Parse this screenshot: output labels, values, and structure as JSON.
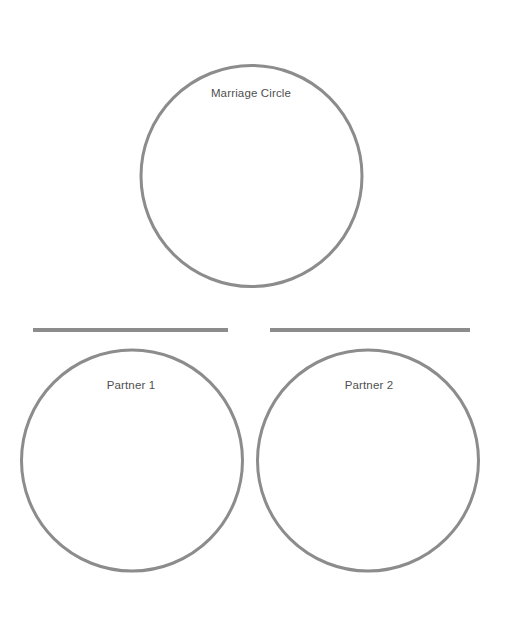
{
  "page": {
    "background_color": "#ffffff",
    "width": 505,
    "height": 633
  },
  "style": {
    "stroke_color": "#8c8c8c",
    "stroke_width": 3,
    "bar_color": "#8c8c8c",
    "label_color": "#4f4f4f"
  },
  "diagram": {
    "type": "venn-style-circles",
    "circles": [
      {
        "id": "marriage-circle",
        "label": "Marriage Circle",
        "cx": 251.5,
        "cy": 176,
        "r": 110.5
      },
      {
        "id": "partner-1-circle",
        "label": "Partner 1",
        "cx": 132,
        "cy": 460.5,
        "r": 110.5
      },
      {
        "id": "partner-2-circle",
        "label": "Partner 2",
        "cx": 368,
        "cy": 460.5,
        "r": 110.5
      }
    ],
    "bars": [
      {
        "id": "left-divider-bar",
        "x1": 33,
        "x2": 228,
        "y": 330,
        "thickness": 4
      },
      {
        "id": "right-divider-bar",
        "x1": 270,
        "x2": 470,
        "y": 330,
        "thickness": 4
      }
    ]
  }
}
